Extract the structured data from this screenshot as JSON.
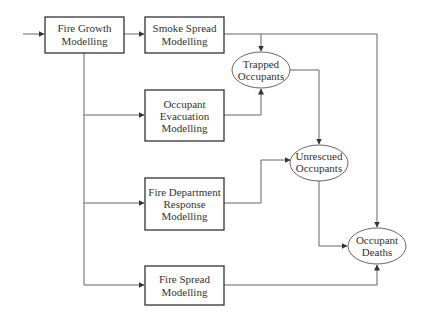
{
  "diagram": {
    "nodes": {
      "fire_growth": {
        "lines": [
          "Fire Growth",
          "Modelling"
        ],
        "shape": "box"
      },
      "smoke_spread": {
        "lines": [
          "Smoke Spread",
          "Modelling"
        ],
        "shape": "box"
      },
      "occupant_evacuation": {
        "lines": [
          "Occupant",
          "Evacuation",
          "Modelling"
        ],
        "shape": "box"
      },
      "fire_department_response": {
        "lines": [
          "Fire Department",
          "Response",
          "Modelling"
        ],
        "shape": "box"
      },
      "fire_spread": {
        "lines": [
          "Fire Spread",
          "Modelling"
        ],
        "shape": "box"
      },
      "trapped_occupants": {
        "lines": [
          "Trapped",
          "Occupants"
        ],
        "shape": "ellipse"
      },
      "unrescued_occupants": {
        "lines": [
          "Unrescued",
          "Occupants"
        ],
        "shape": "ellipse"
      },
      "occupant_deaths": {
        "lines": [
          "Occupant",
          "Deaths"
        ],
        "shape": "ellipse"
      }
    },
    "edges": [
      {
        "from": "input",
        "to": "fire_growth"
      },
      {
        "from": "fire_growth",
        "to": "smoke_spread"
      },
      {
        "from": "fire_growth",
        "to": "occupant_evacuation"
      },
      {
        "from": "fire_growth",
        "to": "fire_department_response"
      },
      {
        "from": "fire_growth",
        "to": "fire_spread"
      },
      {
        "from": "smoke_spread",
        "to": "trapped_occupants"
      },
      {
        "from": "smoke_spread",
        "to": "occupant_deaths"
      },
      {
        "from": "occupant_evacuation",
        "to": "trapped_occupants"
      },
      {
        "from": "trapped_occupants",
        "to": "unrescued_occupants"
      },
      {
        "from": "fire_department_response",
        "to": "unrescued_occupants"
      },
      {
        "from": "unrescued_occupants",
        "to": "occupant_deaths"
      },
      {
        "from": "fire_spread",
        "to": "occupant_deaths"
      }
    ]
  }
}
